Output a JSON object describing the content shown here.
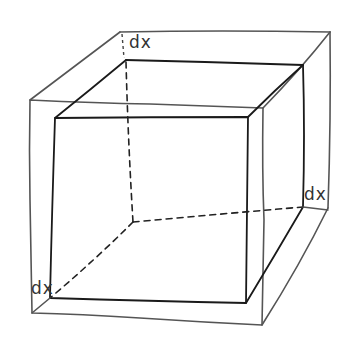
{
  "diagram": {
    "labels": {
      "top": "dx",
      "right": "dx",
      "bottom_left": "dx"
    },
    "colors": {
      "outer_cube": "#555555",
      "inner_cube": "#1a1a1a",
      "background": "#ffffff"
    }
  }
}
